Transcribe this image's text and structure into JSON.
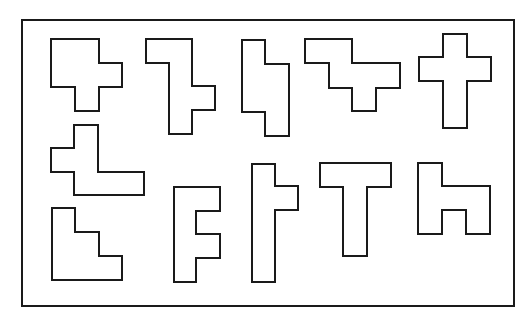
{
  "caption": {
    "text": "",
    "note": "cropped at top edge"
  },
  "figure": {
    "stroke_color": "#1a1a1a",
    "fill_color": "#ffffff",
    "frame": {
      "x": 22,
      "y": 20,
      "width": 492,
      "height": 286
    },
    "shapes": [
      {
        "id": "shape-1",
        "points": "51,39 99,39 99,63 122,63 122,87 99,87 99,111 75,111 75,87 51,87"
      },
      {
        "id": "shape-2",
        "points": "146,39 192,39 192,86 215,86 215,110 192,110 192,134 169,134 169,63 146,63"
      },
      {
        "id": "shape-3",
        "points": "242,40 265,40 265,64 289,64 289,136 265,136 265,112 242,112"
      },
      {
        "id": "shape-4",
        "points": "305,39 352,39 352,63 400,63 400,88 376,88 376,111 352,111 352,88 329,88 329,63 305,63"
      },
      {
        "id": "shape-5",
        "points": "443,34 467,34 467,57 491,57 491,81 467,81 467,128 443,128 443,81 419,81 419,57 443,57"
      },
      {
        "id": "shape-6",
        "points": "74,125 98,125 98,172 144,172 144,195 74,195 74,172 51,172 51,148 74,148"
      },
      {
        "id": "shape-7",
        "points": "52,208 75,208 75,232 99,232 99,256 122,256 122,280 52,280"
      },
      {
        "id": "shape-8",
        "points": "174,187 220,187 220,211 196,211 196,234 220,234 220,258 196,258 196,282 174,282"
      },
      {
        "id": "shape-9",
        "points": "252,164 275,164 275,186 298,186 298,210 275,210 275,282 252,282"
      },
      {
        "id": "shape-10",
        "points": "320,163 391,163 391,187 367,187 367,256 343,256 343,187 320,187"
      },
      {
        "id": "shape-11",
        "points": "418,163 442,163 442,186 490,186 490,234 466,234 466,210 442,210 442,234 418,234"
      }
    ]
  }
}
